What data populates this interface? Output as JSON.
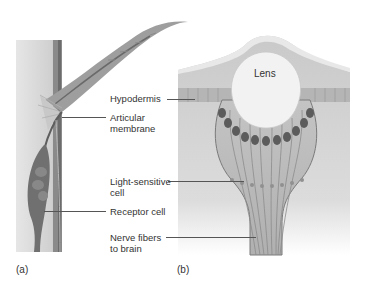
{
  "figure": {
    "panel_a": {
      "tag": "(a)",
      "labels": {
        "articular_membrane": [
          "Articular",
          "membrane"
        ],
        "receptor_cell": "Receptor cell"
      }
    },
    "panel_b": {
      "tag": "(b)",
      "labels": {
        "lens": "Lens",
        "hypodermis": "Hypodermis",
        "light_sensitive_cell": [
          "Light-sensitive",
          "cell"
        ],
        "nerve_fibers": [
          "Nerve fibers",
          "to brain"
        ]
      }
    },
    "colors": {
      "background": "#ffffff",
      "tissue_light": "#d4d4d4",
      "tissue_mid": "#a9a9a9",
      "tissue_dark": "#6f6f6f",
      "cell_dark": "#5c5c5c",
      "lens_fill": "#f2f2f2",
      "leader_line": "#555555",
      "text": "#333333"
    }
  }
}
